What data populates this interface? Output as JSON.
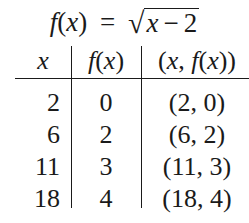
{
  "title": {
    "lhs_func": "f",
    "lhs_open": "(",
    "lhs_var": "x",
    "lhs_close": ")",
    "equals": "=",
    "radical": "√",
    "radicand_var": "x",
    "radicand_op": "−",
    "radicand_const": "2"
  },
  "table": {
    "headers": {
      "x": "x",
      "fx_func": "f",
      "fx_open": "(",
      "fx_var": "x",
      "fx_close": ")",
      "pair_open": "(",
      "pair_var": "x",
      "pair_sep": ", ",
      "pair_func": "f",
      "pair_inner_open": "(",
      "pair_inner_var": "x",
      "pair_close": "))"
    },
    "rows": [
      {
        "x": "2",
        "fx": "0",
        "pair": "(2, 0)"
      },
      {
        "x": "6",
        "fx": "2",
        "pair": "(6, 2)"
      },
      {
        "x": "11",
        "fx": "3",
        "pair": "(11, 3)"
      },
      {
        "x": "18",
        "fx": "4",
        "pair": "(18, 4)"
      }
    ]
  }
}
